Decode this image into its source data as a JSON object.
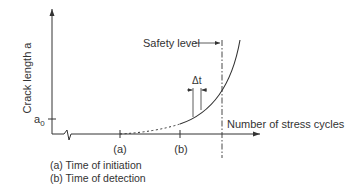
{
  "diagram": {
    "y_axis_label": "Crack length a",
    "x_axis_label": "Number of stress cycles",
    "a0_label": "a",
    "a0_subscript": "0",
    "safety_label": "Safety level",
    "delta_t_label": "Δt",
    "tick_a_label": "(a)",
    "tick_b_label": "(b)",
    "legend": [
      "(a) Time of initiation",
      "(b) Time of detection"
    ],
    "colors": {
      "line": "#333333",
      "text": "#333333"
    }
  }
}
